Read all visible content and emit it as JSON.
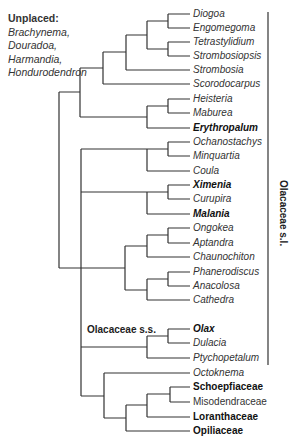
{
  "unplaced": {
    "header": "Unplaced:",
    "genera": [
      "Brachynema,",
      "Douradoa,",
      "Harmandia,",
      "Hondurodendron"
    ]
  },
  "leaves": [
    {
      "name": "Diogoa",
      "style": "italic"
    },
    {
      "name": "Engomegoma",
      "style": "italic"
    },
    {
      "name": "Tetrastylidium",
      "style": "italic"
    },
    {
      "name": "Strombosiopsis",
      "style": "italic"
    },
    {
      "name": "Strombosia",
      "style": "italic"
    },
    {
      "name": "Scorodocarpus",
      "style": "italic"
    },
    {
      "name": "Heisteria",
      "style": "italic"
    },
    {
      "name": "Maburea",
      "style": "italic"
    },
    {
      "name": "Erythropalum",
      "style": "bold-italic"
    },
    {
      "name": "Ochanostachys",
      "style": "italic"
    },
    {
      "name": "Minquartia",
      "style": "italic"
    },
    {
      "name": "Coula",
      "style": "italic"
    },
    {
      "name": "Ximenia",
      "style": "bold-italic"
    },
    {
      "name": "Curupira",
      "style": "italic"
    },
    {
      "name": "Malania",
      "style": "bold-italic"
    },
    {
      "name": "Ongokea",
      "style": "italic"
    },
    {
      "name": "Aptandra",
      "style": "italic"
    },
    {
      "name": "Chaunochiton",
      "style": "italic"
    },
    {
      "name": "Phanerodiscus",
      "style": "italic"
    },
    {
      "name": "Anacolosa",
      "style": "italic"
    },
    {
      "name": "Cathedra",
      "style": "italic"
    },
    {
      "name": "Olax",
      "style": "bold-italic"
    },
    {
      "name": "Dulacia",
      "style": "italic"
    },
    {
      "name": "Ptychopetalum",
      "style": "italic"
    },
    {
      "name": "Octoknema",
      "style": "italic"
    },
    {
      "name": "Schoepfiaceae",
      "style": "bold"
    },
    {
      "name": "Misodendraceae",
      "style": "normal"
    },
    {
      "name": "Loranthaceae",
      "style": "bold"
    },
    {
      "name": "Opiliaceae",
      "style": "bold"
    }
  ],
  "clades": {
    "olacaceae_ss": "Olacaceae s.s.",
    "olacaceae_sl": "Olacaceae s.l."
  },
  "colors": {
    "line": "#333333",
    "background": "#ffffff"
  }
}
